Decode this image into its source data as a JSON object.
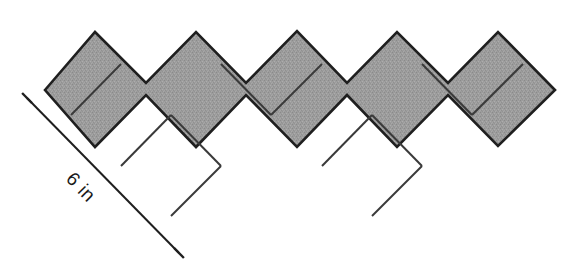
{
  "figure": {
    "name": "zigzag-square-tiling-figure",
    "description_shape": "W-shaped strip of eight squares rotated 45 degrees",
    "square_count": 8,
    "fill_color": "#9c9c9c",
    "outline_color": "#1f1f1f",
    "background_color": "#ffffff",
    "interior_line_color": "#3a3a3a",
    "outline_width": 2.6,
    "interior_line_width": 2.0
  },
  "dimension": {
    "label": "6 in",
    "value": 6,
    "unit": "in",
    "rotation_degrees": 45.6,
    "line_color": "#1f1f1f",
    "line_width": 2.0,
    "tick_length": 14,
    "start": {
      "x": 27,
      "y": 98
    },
    "end": {
      "x": 179,
      "y": 253
    },
    "label_position": {
      "x": 80,
      "y": 188
    }
  },
  "geometry": {
    "unit": 50.2,
    "origin": {
      "x": 45.0,
      "y": 90.0
    },
    "outline_points": "45,90 95,32 146,83 196,32 246,83 297,31 347,83 397,32 448,83 498,32 555,90 498,146 448,95 397,147 347,95 297,147 246,95 196,147 146,95 95,147",
    "outline_points_note": "apex and valley vertices of the W strip, traced outer then inner",
    "squares": [
      {
        "id": "sq-1",
        "center": {
          "x": 96.5,
          "y": 89.5
        },
        "arm": "left-up"
      },
      {
        "id": "sq-2",
        "center": {
          "x": 146.5,
          "y": 139.5
        },
        "arm": "left-up"
      },
      {
        "id": "sq-3",
        "center": {
          "x": 196.5,
          "y": 189.5
        },
        "arm": "left-down"
      },
      {
        "id": "sq-4",
        "center": {
          "x": 246.5,
          "y": 139.5
        },
        "arm": "left-down"
      },
      {
        "id": "sq-5",
        "center": {
          "x": 297.0,
          "y": 89.0
        },
        "arm": "middle-peak"
      },
      {
        "id": "sq-6",
        "center": {
          "x": 347.0,
          "y": 139.0
        },
        "arm": "right-down"
      },
      {
        "id": "sq-7",
        "center": {
          "x": 397.0,
          "y": 189.0
        },
        "arm": "right-down"
      },
      {
        "id": "sq-8",
        "center": {
          "x": 447.5,
          "y": 139.5
        },
        "arm": "right-up"
      },
      {
        "id": "sq-9",
        "center": {
          "x": 498.0,
          "y": 89.0
        },
        "arm": "right-up"
      }
    ],
    "interior_lines": [
      {
        "id": "div-1",
        "x1": 71.0,
        "y1": 115.0,
        "x2": 121.0,
        "y2": 64.0
      },
      {
        "id": "div-2",
        "x1": 121.0,
        "y1": 166.0,
        "x2": 171.0,
        "y2": 115.0
      },
      {
        "id": "div-3",
        "x1": 171.0,
        "y1": 216.0,
        "x2": 221.0,
        "y2": 166.0
      },
      {
        "id": "div-4",
        "x1": 171.0,
        "y1": 115.0,
        "x2": 221.0,
        "y2": 166.0
      },
      {
        "id": "div-5",
        "x1": 221.0,
        "y1": 64.0,
        "x2": 271.0,
        "y2": 115.0
      },
      {
        "id": "div-6",
        "x1": 271.0,
        "y1": 115.0,
        "x2": 322.0,
        "y2": 64.0
      },
      {
        "id": "div-7",
        "x1": 322.0,
        "y1": 166.0,
        "x2": 372.0,
        "y2": 115.0
      },
      {
        "id": "div-8",
        "x1": 372.0,
        "y1": 216.0,
        "x2": 422.0,
        "y2": 166.0
      },
      {
        "id": "div-9",
        "x1": 372.0,
        "y1": 115.0,
        "x2": 422.0,
        "y2": 166.0
      },
      {
        "id": "div-10",
        "x1": 422.0,
        "y1": 64.0,
        "x2": 472.0,
        "y2": 115.0
      },
      {
        "id": "div-11",
        "x1": 472.0,
        "y1": 115.0,
        "x2": 523.0,
        "y2": 64.0
      }
    ]
  }
}
